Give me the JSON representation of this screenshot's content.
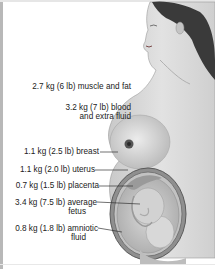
{
  "labels": {
    "muscle_fat": "2.7 kg (6 lb) muscle and fat",
    "blood_line1": "3.2 kg (7 lb) blood",
    "blood_line2": "and extra fluid",
    "breast": "1.1 kg (2.5 lb) breast",
    "uterus": "1.1 kg (2.0 lb) uterus",
    "placenta": "0.7 kg (1.5 lb) placenta",
    "fetus_line1": "3.4 kg (7.5 lb) average",
    "fetus_line2": "fetus",
    "amniotic_line1": "0.8 kg (1.8 lb) amniotic",
    "amniotic_line2": "fluid"
  },
  "colors": {
    "skin": "#d6d6d6",
    "hair": "#3a3a3a",
    "uterus_wall": "#6a6a6a",
    "leader_line": "#333333"
  }
}
